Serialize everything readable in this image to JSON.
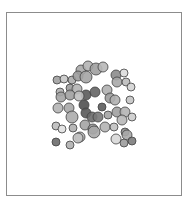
{
  "chart_data": {
    "type": "scatter",
    "subtype": "bubble",
    "title": "",
    "xlabel": "",
    "ylabel": "",
    "axes_visible": false,
    "grid": false,
    "legend": null,
    "frame": {
      "x": 6,
      "y": 12,
      "width": 176,
      "height": 184,
      "stroke": "#8c8c8c"
    },
    "stroke_color": "#404040",
    "points": [
      {
        "x": 81,
        "y": 70,
        "r": 5,
        "fill": "#a8a8a8"
      },
      {
        "x": 88,
        "y": 66,
        "r": 5,
        "fill": "#b4b4b4"
      },
      {
        "x": 96,
        "y": 69,
        "r": 6,
        "fill": "#a0a0a0"
      },
      {
        "x": 103,
        "y": 67,
        "r": 5,
        "fill": "#b8b8b8"
      },
      {
        "x": 57,
        "y": 80,
        "r": 4,
        "fill": "#a0a0a0"
      },
      {
        "x": 64,
        "y": 79,
        "r": 4,
        "fill": "#c8c8c8"
      },
      {
        "x": 72,
        "y": 80,
        "r": 4,
        "fill": "#acacac"
      },
      {
        "x": 78,
        "y": 76,
        "r": 5,
        "fill": "#9c9c9c"
      },
      {
        "x": 86,
        "y": 77,
        "r": 6,
        "fill": "#a4a4a4"
      },
      {
        "x": 116,
        "y": 75,
        "r": 5,
        "fill": "#8c8c8c"
      },
      {
        "x": 124,
        "y": 73,
        "r": 4,
        "fill": "#dcdcdc"
      },
      {
        "x": 60,
        "y": 92,
        "r": 4,
        "fill": "#b0b0b0"
      },
      {
        "x": 70,
        "y": 88,
        "r": 4,
        "fill": "#9c9c9c"
      },
      {
        "x": 77,
        "y": 89,
        "r": 5,
        "fill": "#b4b4b4"
      },
      {
        "x": 86,
        "y": 95,
        "r": 5,
        "fill": "#5a5a5a"
      },
      {
        "x": 95,
        "y": 92,
        "r": 5,
        "fill": "#646464"
      },
      {
        "x": 107,
        "y": 90,
        "r": 5,
        "fill": "#b0b0b0"
      },
      {
        "x": 117,
        "y": 82,
        "r": 5,
        "fill": "#a8a8a8"
      },
      {
        "x": 126,
        "y": 82,
        "r": 4,
        "fill": "#bcbcbc"
      },
      {
        "x": 131,
        "y": 87,
        "r": 4,
        "fill": "#d4d4d4"
      },
      {
        "x": 61,
        "y": 97,
        "r": 5,
        "fill": "#a4a4a4"
      },
      {
        "x": 70,
        "y": 95,
        "r": 5,
        "fill": "#a0a0a0"
      },
      {
        "x": 79,
        "y": 96,
        "r": 5,
        "fill": "#c0c0c0"
      },
      {
        "x": 110,
        "y": 98,
        "r": 5,
        "fill": "#9c9c9c"
      },
      {
        "x": 115,
        "y": 100,
        "r": 5,
        "fill": "#b0b0b0"
      },
      {
        "x": 130,
        "y": 100,
        "r": 4,
        "fill": "#c4c4c4"
      },
      {
        "x": 58,
        "y": 108,
        "r": 5,
        "fill": "#b4b4b4"
      },
      {
        "x": 69,
        "y": 108,
        "r": 5,
        "fill": "#a8a8a8"
      },
      {
        "x": 84,
        "y": 105,
        "r": 5,
        "fill": "#505050"
      },
      {
        "x": 102,
        "y": 107,
        "r": 4,
        "fill": "#5c5c5c"
      },
      {
        "x": 117,
        "y": 112,
        "r": 5,
        "fill": "#a0a0a0"
      },
      {
        "x": 125,
        "y": 112,
        "r": 5,
        "fill": "#b4b4b4"
      },
      {
        "x": 132,
        "y": 117,
        "r": 4,
        "fill": "#cccccc"
      },
      {
        "x": 72,
        "y": 117,
        "r": 6,
        "fill": "#acacac"
      },
      {
        "x": 86,
        "y": 113,
        "r": 5,
        "fill": "#5a5a5a"
      },
      {
        "x": 92,
        "y": 117,
        "r": 5,
        "fill": "#6c6c6c"
      },
      {
        "x": 98,
        "y": 117,
        "r": 5,
        "fill": "#787878"
      },
      {
        "x": 108,
        "y": 115,
        "r": 4,
        "fill": "#a4a4a4"
      },
      {
        "x": 122,
        "y": 120,
        "r": 5,
        "fill": "#b8b8b8"
      },
      {
        "x": 56,
        "y": 126,
        "r": 4,
        "fill": "#bcbcbc"
      },
      {
        "x": 62,
        "y": 129,
        "r": 4,
        "fill": "#e0e0e0"
      },
      {
        "x": 73,
        "y": 128,
        "r": 4,
        "fill": "#b0b0b0"
      },
      {
        "x": 85,
        "y": 125,
        "r": 5,
        "fill": "#a4a4a4"
      },
      {
        "x": 93,
        "y": 129,
        "r": 5,
        "fill": "#9c9c9c"
      },
      {
        "x": 105,
        "y": 127,
        "r": 5,
        "fill": "#b4b4b4"
      },
      {
        "x": 114,
        "y": 127,
        "r": 4,
        "fill": "#c0c0c0"
      },
      {
        "x": 125,
        "y": 132,
        "r": 4,
        "fill": "#8c8c8c"
      },
      {
        "x": 80,
        "y": 137,
        "r": 5,
        "fill": "#b4b4b4"
      },
      {
        "x": 94,
        "y": 132,
        "r": 6,
        "fill": "#a8a8a8"
      },
      {
        "x": 116,
        "y": 139,
        "r": 5,
        "fill": "#d8d8d8"
      },
      {
        "x": 127,
        "y": 135,
        "r": 5,
        "fill": "#a8a8a8"
      },
      {
        "x": 132,
        "y": 141,
        "r": 4,
        "fill": "#7c7c7c"
      },
      {
        "x": 56,
        "y": 142,
        "r": 4,
        "fill": "#6c6c6c"
      },
      {
        "x": 70,
        "y": 145,
        "r": 4,
        "fill": "#b0b0b0"
      },
      {
        "x": 78,
        "y": 138,
        "r": 5,
        "fill": "#c4c4c4"
      },
      {
        "x": 124,
        "y": 143,
        "r": 4,
        "fill": "#9c9c9c"
      }
    ]
  }
}
